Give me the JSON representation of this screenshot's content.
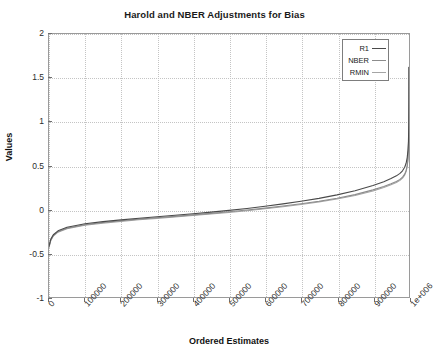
{
  "chart_data": {
    "type": "line",
    "title": "Harold and NBER Adjustments for Bias",
    "xlabel": "Ordered Estimates",
    "ylabel": "Values",
    "xlim": [
      0,
      1000000
    ],
    "ylim": [
      -1,
      2
    ],
    "grid": true,
    "legend_position": "upper right",
    "xticks": [
      0,
      100000,
      200000,
      300000,
      400000,
      500000,
      600000,
      700000,
      800000,
      900000,
      1000000
    ],
    "xticklabels": [
      "0",
      "100000",
      "200000",
      "300000",
      "400000",
      "500000",
      "600000",
      "700000",
      "800000",
      "900000",
      "1e+006"
    ],
    "yticks": [
      -1,
      -0.5,
      0,
      0.5,
      1,
      1.5,
      2
    ],
    "yticklabels": [
      "-1",
      "-0.5",
      "0",
      "0.5",
      "1",
      "1.5",
      "2"
    ],
    "series": [
      {
        "name": "R1",
        "color": "#4a4a4a",
        "x": [
          0,
          5000,
          12000,
          25000,
          50000,
          100000,
          150000,
          200000,
          250000,
          300000,
          350000,
          400000,
          450000,
          500000,
          550000,
          600000,
          650000,
          700000,
          750000,
          800000,
          850000,
          900000,
          930000,
          950000,
          965000,
          975000,
          982000,
          988000,
          992000,
          995000,
          997000,
          998500,
          999400,
          999800,
          1000000
        ],
        "y": [
          -0.42,
          -0.34,
          -0.29,
          -0.245,
          -0.205,
          -0.165,
          -0.14,
          -0.12,
          -0.102,
          -0.085,
          -0.068,
          -0.05,
          -0.032,
          -0.012,
          0.01,
          0.035,
          0.062,
          0.092,
          0.125,
          0.165,
          0.212,
          0.272,
          0.315,
          0.352,
          0.382,
          0.41,
          0.44,
          0.48,
          0.525,
          0.59,
          0.67,
          0.78,
          0.96,
          1.25,
          1.62
        ]
      },
      {
        "name": "NBER",
        "color": "#8c8c8c",
        "x": [
          0,
          5000,
          12000,
          25000,
          50000,
          100000,
          150000,
          200000,
          250000,
          300000,
          350000,
          400000,
          450000,
          500000,
          550000,
          600000,
          650000,
          700000,
          750000,
          800000,
          850000,
          900000,
          930000,
          950000,
          965000,
          975000,
          982000,
          988000,
          992000,
          995000,
          997000,
          998500,
          999400,
          999800,
          1000000
        ],
        "y": [
          -0.43,
          -0.35,
          -0.3,
          -0.255,
          -0.215,
          -0.175,
          -0.15,
          -0.13,
          -0.112,
          -0.096,
          -0.08,
          -0.063,
          -0.046,
          -0.028,
          -0.008,
          0.014,
          0.038,
          0.064,
          0.093,
          0.127,
          0.168,
          0.222,
          0.26,
          0.292,
          0.318,
          0.342,
          0.368,
          0.402,
          0.442,
          0.5,
          0.575,
          0.69,
          0.9,
          1.22,
          1.62
        ]
      },
      {
        "name": "RMIN",
        "color": "#a5a5a5",
        "x": [
          0,
          5000,
          12000,
          25000,
          50000,
          100000,
          150000,
          200000,
          250000,
          300000,
          350000,
          400000,
          450000,
          500000,
          550000,
          600000,
          650000,
          700000,
          750000,
          800000,
          850000,
          900000,
          930000,
          950000,
          965000,
          975000,
          982000,
          988000,
          992000,
          995000,
          997000,
          998500,
          999400,
          999800,
          1000000
        ],
        "y": [
          -0.435,
          -0.355,
          -0.305,
          -0.26,
          -0.22,
          -0.182,
          -0.157,
          -0.137,
          -0.119,
          -0.103,
          -0.087,
          -0.071,
          -0.054,
          -0.036,
          -0.016,
          0.006,
          0.03,
          0.056,
          0.085,
          0.118,
          0.158,
          0.21,
          0.248,
          0.28,
          0.305,
          0.33,
          0.356,
          0.39,
          0.43,
          0.488,
          0.562,
          0.678,
          0.89,
          1.21,
          1.62
        ]
      }
    ]
  },
  "legend": {
    "items": [
      {
        "label": "R1"
      },
      {
        "label": "NBER"
      },
      {
        "label": "RMIN"
      }
    ]
  }
}
